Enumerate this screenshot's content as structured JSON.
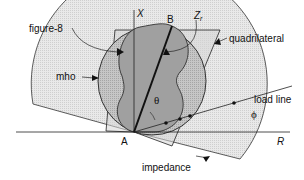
{
  "diagram": {
    "labels": {
      "x_axis": "X",
      "r_axis": "R",
      "point_a": "A",
      "point_b": "B",
      "zr": "Z",
      "zr_sub": "r",
      "figure8": "figure-8",
      "quadrilateral": "quadrilateral",
      "mho": "mho",
      "theta": "θ",
      "load_line": "load line",
      "phi": "ϕ",
      "impedance": "impedance"
    },
    "colors": {
      "impedance_fill": "#e6e6e6",
      "quad_fill": "#d4d4d4",
      "mho_fill": "#b4b4b4",
      "figure8_fill": "#9a9a9a",
      "stroke": "#1a1a1a"
    }
  }
}
